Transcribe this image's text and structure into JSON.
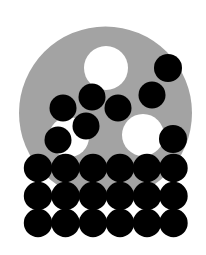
{
  "diagram": {
    "colors": {
      "background": "#ffffff",
      "disc": "#a3a3a3",
      "hole": "#ffffff",
      "dot": "#000000"
    },
    "disc": {
      "cx": 105.5,
      "cy": 113,
      "r": 86.5
    },
    "holes": [
      {
        "cx": 106,
        "cy": 68,
        "r": 22
      },
      {
        "cx": 143,
        "cy": 135,
        "r": 21
      },
      {
        "cx": 69,
        "cy": 137,
        "r": 20
      }
    ],
    "scattered_dots": [
      {
        "cx": 168,
        "cy": 68,
        "r": 14
      },
      {
        "cx": 152,
        "cy": 95,
        "r": 13.5
      },
      {
        "cx": 92,
        "cy": 97,
        "r": 13.5
      },
      {
        "cx": 63,
        "cy": 108,
        "r": 13.5
      },
      {
        "cx": 118,
        "cy": 108,
        "r": 13.5
      },
      {
        "cx": 86,
        "cy": 126,
        "r": 13.5
      },
      {
        "cx": 58,
        "cy": 140,
        "r": 13.5
      },
      {
        "cx": 173,
        "cy": 139,
        "r": 14
      }
    ],
    "grid": {
      "columns_x": [
        38,
        65.5,
        93,
        120,
        147,
        173.5
      ],
      "rows_y": [
        168,
        196,
        223
      ],
      "r": 14.2
    }
  }
}
